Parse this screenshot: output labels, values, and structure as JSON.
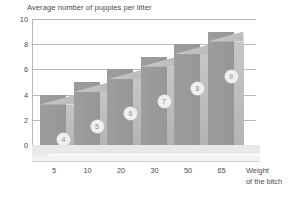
{
  "chart_data": {
    "type": "bar",
    "title": "Average number of puppies per litter",
    "xlabel": "Weight of the bitch",
    "ylabel": "",
    "categories": [
      "5",
      "10",
      "20",
      "30",
      "50",
      "65"
    ],
    "values": [
      4,
      5,
      6,
      7,
      8,
      9
    ],
    "point_labels": [
      "4",
      "5",
      "6",
      "7",
      "8",
      "9"
    ],
    "ylim": [
      0,
      10
    ],
    "ytick_labels": [
      "0",
      "2",
      "4",
      "6",
      "8",
      "10"
    ],
    "ytick_values": [
      0,
      2,
      4,
      6,
      8,
      10
    ],
    "grid": true,
    "legend": false,
    "style": "3d-bar",
    "colors": {
      "bar_front": "#9a9a9a",
      "bar_side": "#c7c7c7",
      "bar_top": "#c4c4c4",
      "gridline": "#b9b9b9",
      "floor": "#e8e8e8",
      "background": "#ffffff",
      "text": "#4a4a4a",
      "marker_fill": "#f0f0f0"
    }
  },
  "xlabel_lines": [
    "Weight",
    "of the bitch"
  ]
}
